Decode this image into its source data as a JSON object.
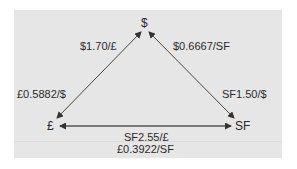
{
  "diagram": {
    "nodes": {
      "dollar": "$",
      "pound": "£",
      "franc": "SF"
    },
    "edges": {
      "pound_dollar": {
        "upper": "$1.70/£",
        "lower": "£0.5882/$"
      },
      "dollar_franc": {
        "upper": "$0.6667/SF",
        "lower": "SF1.50/$"
      },
      "pound_franc": {
        "upper": "SF2.55/£",
        "lower": "£0.3922/SF"
      }
    },
    "colors": {
      "panel": "#e6e6e6",
      "line": "#333333",
      "bottom_line": "#555555",
      "text": "#2a2a2a"
    }
  }
}
